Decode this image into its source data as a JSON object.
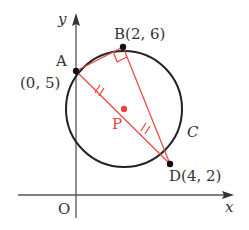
{
  "diagram": {
    "type": "coordinate-geometry",
    "colors": {
      "axis": "#555555",
      "circle": "#222222",
      "segment": "#e8453c",
      "point": "#111111",
      "center": "#e8453c",
      "label": "#333333"
    },
    "axes": {
      "x_label": "x",
      "y_label": "y",
      "origin_label": "O"
    },
    "circle": {
      "label": "C",
      "center_label": "P"
    },
    "points": {
      "A": {
        "name": "A",
        "coord_label": "(0, 5)",
        "x": 0,
        "y": 5
      },
      "B": {
        "name": "B",
        "coord_label": "B(2, 6)",
        "x": 2,
        "y": 6
      },
      "D": {
        "name": "D",
        "coord_label": "D(4, 2)",
        "x": 4,
        "y": 2
      },
      "P": {
        "name": "P"
      }
    },
    "segments": [
      "AB",
      "BD",
      "AD"
    ],
    "annotations": {
      "right_angle_at": "B",
      "equal_marks": [
        "AP",
        "PD"
      ]
    }
  }
}
